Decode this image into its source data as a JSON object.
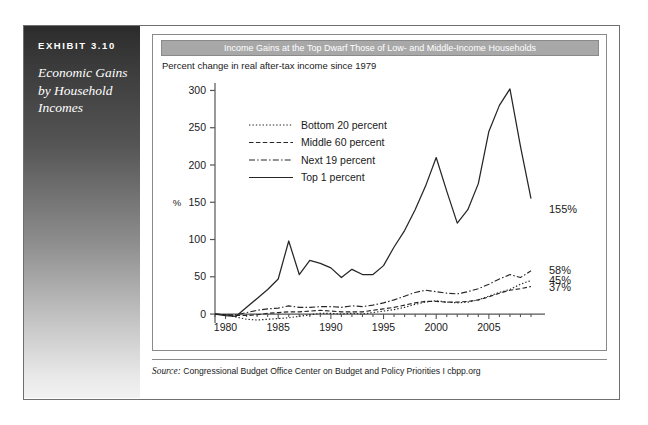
{
  "exhibit": {
    "tag": "EXHIBIT 3.10",
    "caption": "Economic Gains by Household Incomes"
  },
  "chart_card": {
    "title": "Income Gains at the Top Dwarf Those of Low- and Middle-Income Households",
    "subtitle": "Percent change in real after-tax income since 1979",
    "source_label": "Source:",
    "source_text": " Congressional Budget Office Center on Budget and Policy Priorities I cbpp.org",
    "title_bar_color": "#a8a8a8",
    "frame_color": "#6f6f6f"
  },
  "chart_data": {
    "type": "line",
    "title": "Income Gains at the Top Dwarf Those of Low- and Middle-Income Households",
    "subtitle": "Percent change in real after-tax income since 1979",
    "xlabel": "",
    "ylabel": "%",
    "xlim": [
      1979,
      2009
    ],
    "ylim": [
      -12,
      310
    ],
    "yticks": [
      0,
      50,
      100,
      150,
      200,
      250,
      300
    ],
    "ytick_labels": [
      "0",
      "50",
      "100",
      "150",
      "200",
      "250",
      "300"
    ],
    "xticks": [
      1980,
      1985,
      1990,
      1995,
      2000,
      2005
    ],
    "xtick_labels": [
      "1980",
      "1985",
      "1990",
      "1995",
      "2000",
      "2005"
    ],
    "minor_xticks_every": 1,
    "grid": false,
    "legend_position": "upper-left-inside",
    "x": [
      1979,
      1980,
      1981,
      1982,
      1983,
      1984,
      1985,
      1986,
      1987,
      1988,
      1989,
      1990,
      1991,
      1992,
      1993,
      1994,
      1995,
      1996,
      1997,
      1998,
      1999,
      2000,
      2001,
      2002,
      2003,
      2004,
      2005,
      2006,
      2007,
      2008,
      2009
    ],
    "series": [
      {
        "name": "Bottom 20 percent",
        "style": "dotted",
        "end_label": "45%",
        "values": [
          0,
          -1,
          -4,
          -7,
          -8,
          -7,
          -6,
          -5,
          -3,
          -1,
          1,
          1,
          0,
          1,
          0,
          2,
          4,
          6,
          9,
          13,
          16,
          18,
          16,
          15,
          16,
          19,
          24,
          29,
          33,
          40,
          45
        ]
      },
      {
        "name": "Middle 60 percent",
        "style": "dashed",
        "end_label": "37%",
        "values": [
          0,
          -1,
          -2,
          -2,
          -1,
          1,
          2,
          3,
          3,
          4,
          5,
          4,
          3,
          3,
          3,
          5,
          7,
          9,
          12,
          15,
          17,
          17,
          16,
          16,
          17,
          19,
          23,
          28,
          32,
          34,
          37
        ]
      },
      {
        "name": "Next 19 percent",
        "style": "dashdot",
        "end_label": "58%",
        "values": [
          0,
          -1,
          -1,
          2,
          5,
          7,
          8,
          11,
          9,
          9,
          10,
          10,
          9,
          11,
          10,
          12,
          15,
          19,
          24,
          29,
          32,
          30,
          28,
          27,
          30,
          34,
          40,
          47,
          53,
          49,
          58
        ]
      },
      {
        "name": "Top 1 percent",
        "style": "solid",
        "end_label": "155%",
        "values": [
          0,
          -2,
          -3,
          9,
          21,
          33,
          47,
          98,
          53,
          72,
          68,
          62,
          49,
          60,
          53,
          53,
          65,
          90,
          112,
          140,
          172,
          210,
          165,
          122,
          140,
          175,
          245,
          280,
          302,
          225,
          155
        ]
      }
    ],
    "end_labels": [
      {
        "text": "155%",
        "series": "Top 1 percent"
      },
      {
        "text": "58%",
        "series": "Next 19 percent"
      },
      {
        "text": "45%",
        "series": "Bottom 20 percent"
      },
      {
        "text": "37%",
        "series": "Middle 60 percent"
      }
    ],
    "legend": [
      {
        "label": "Bottom 20 percent",
        "style": "dotted"
      },
      {
        "label": "Middle 60 percent",
        "style": "dashed"
      },
      {
        "label": "Next 19 percent",
        "style": "dashdot"
      },
      {
        "label": "Top 1 percent",
        "style": "solid"
      }
    ]
  }
}
